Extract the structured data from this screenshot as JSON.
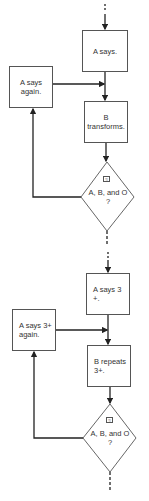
{
  "diagrams": [
    {
      "start_box": "A says.",
      "side_box": "A says again.",
      "middle_box": "B transforms.",
      "decision": {
        "icon": "≈",
        "text_line1": "A, B, and O",
        "text_line2": "?"
      }
    },
    {
      "start_box": "A says 3 +.",
      "side_box": "A says 3+ again.",
      "middle_box": "B repeats 3+.",
      "decision": {
        "icon": "≈",
        "text_line1": "A, B, and O",
        "text_line2": "?"
      }
    }
  ],
  "colors": {
    "line": "#222222",
    "box_border": "#555555",
    "text": "#333333"
  }
}
